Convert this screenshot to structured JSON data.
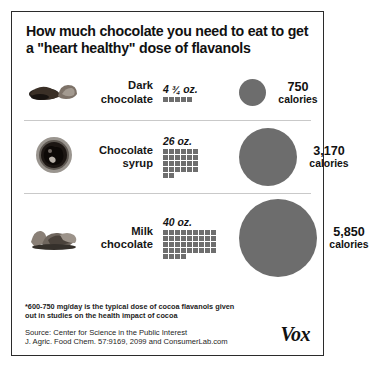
{
  "title": "How much chocolate you need to eat to get a \"heart healthy\" dose of flavanols",
  "brand": "Vox",
  "colors": {
    "square": "#6e6e6e",
    "circle": "#6d6d6d",
    "border": "#2b2b2b",
    "divider": "#c9c9c9",
    "text": "#111111"
  },
  "footnote": "*600-750 mg/day is the typical dose of cocoa flavanols given out in studies on the health impact of cocoa",
  "source_line_1": "Source:  Center for Science in the Public Interest",
  "source_line_2": "J. Agric. Food Chem. 57:9169, 2099 and ConsumerLab.com",
  "units": {
    "calories_word": "calories",
    "amount_unit": "oz."
  },
  "rows": [
    {
      "food": "Dark chocolate",
      "food_line_1": "Dark",
      "food_line_2": "chocolate",
      "photo_name": "dark-chocolate-photo",
      "amount_text": "4 ¾ oz.",
      "amount_oz": 4.75,
      "squares": 5,
      "grid_cols": 5,
      "calories_text": "750",
      "calories": 750,
      "circle_px": 27
    },
    {
      "food": "Chocolate syrup",
      "food_line_1": "Chocolate",
      "food_line_2": "syrup",
      "photo_name": "chocolate-syrup-photo",
      "amount_text": "26 oz.",
      "amount_oz": 26,
      "squares": 26,
      "grid_cols": 5,
      "calories_text": "3,170",
      "calories": 3170,
      "circle_px": 58
    },
    {
      "food": "Milk chocolate",
      "food_line_1": "Milk",
      "food_line_2": "chocolate",
      "photo_name": "milk-chocolate-photo",
      "amount_text": "40 oz.",
      "amount_oz": 40,
      "squares": 40,
      "grid_cols": 8,
      "calories_text": "5,850",
      "calories": 5850,
      "circle_px": 78
    }
  ],
  "chart_data": {
    "type": "bar",
    "title": "How much chocolate you need to eat to get a \"heart healthy\" dose of flavanols",
    "xlabel": "",
    "ylabel": "",
    "categories": [
      "Dark chocolate",
      "Chocolate syrup",
      "Milk chocolate"
    ],
    "series": [
      {
        "name": "Amount needed (oz.)",
        "values": [
          4.75,
          26,
          40
        ],
        "labels": [
          "4 ¾ oz.",
          "26 oz.",
          "40 oz."
        ],
        "encoding": "unit-squares, 1 square = 1 oz."
      },
      {
        "name": "Calories",
        "values": [
          750,
          3170,
          5850
        ],
        "labels": [
          "750 calories",
          "3,170 calories",
          "5,850 calories"
        ],
        "encoding": "circle area proportional to calories"
      }
    ],
    "grid": false,
    "legend": "none",
    "annotations": [
      "*600-750 mg/day is the typical dose of cocoa flavanols given out in studies on the health impact of cocoa",
      "Source:  Center for Science in the Public Interest",
      "J. Agric. Food Chem. 57:9169, 2099 and ConsumerLab.com"
    ]
  }
}
